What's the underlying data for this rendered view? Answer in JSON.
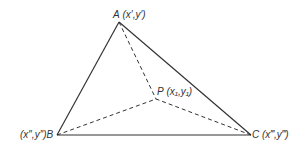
{
  "diagram": {
    "type": "triangle-with-interior-point",
    "colors": {
      "stroke": "#333333",
      "text": "#333333",
      "background": "#ffffff"
    },
    "vertices": {
      "A": {
        "label": "A",
        "coords": "(x′,y′)",
        "x": 119,
        "y": 22
      },
      "B": {
        "label": "B",
        "coords": "(x″,y″)",
        "x": 57,
        "y": 135
      },
      "C": {
        "label": "C",
        "coords": "(x‴,y‴)",
        "x": 251,
        "y": 135
      },
      "P": {
        "label": "P",
        "coords": "(x₁,y₁)",
        "x": 156,
        "y": 99
      }
    },
    "edges": [
      {
        "from": "A",
        "to": "B",
        "style": "solid"
      },
      {
        "from": "A",
        "to": "C",
        "style": "solid"
      },
      {
        "from": "B",
        "to": "C",
        "style": "solid"
      },
      {
        "from": "A",
        "to": "P",
        "style": "dashed"
      },
      {
        "from": "B",
        "to": "P",
        "style": "dashed"
      },
      {
        "from": "C",
        "to": "P",
        "style": "dashed"
      }
    ]
  }
}
